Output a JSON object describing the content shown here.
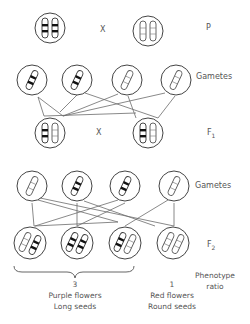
{
  "labels": {
    "p": "P",
    "gametes_1": "Gametes",
    "f1": "F",
    "f1_sub": "1",
    "gametes_2": "Gametes",
    "f2": "F",
    "f2_sub": "2",
    "cross_1": "X",
    "cross_2": "X",
    "phenotype_ratio_line1": "Phenotype",
    "phenotype_ratio_line2": "ratio"
  },
  "phenotypes": [
    {
      "ratio": "3",
      "line1": "Purple flowers",
      "line2": "Long seeds"
    },
    {
      "ratio": "1",
      "line1": "Red flowers",
      "line2": "Round seeds"
    }
  ],
  "generations": {
    "P": [
      {
        "genotype": "homozygous dominant (banded)",
        "chromosomes": [
          "banded",
          "banded"
        ]
      },
      {
        "genotype": "homozygous recessive (plain)",
        "chromosomes": [
          "plain",
          "plain"
        ]
      }
    ],
    "gametes_1": [
      "banded",
      "banded",
      "plain",
      "plain"
    ],
    "F1": [
      {
        "chromosomes": [
          "banded",
          "plain"
        ]
      },
      {
        "chromosomes": [
          "banded",
          "plain"
        ]
      }
    ],
    "gametes_2": [
      "plain",
      "banded",
      "banded",
      "plain"
    ],
    "F2": [
      {
        "chromosomes": [
          "plain",
          "banded"
        ]
      },
      {
        "chromosomes": [
          "banded",
          "banded"
        ]
      },
      {
        "chromosomes": [
          "banded",
          "plain"
        ]
      },
      {
        "chromosomes": [
          "plain",
          "plain"
        ]
      }
    ]
  },
  "colors": {
    "line": "#6b6b6b",
    "band": "#111111",
    "text": "#555555"
  }
}
